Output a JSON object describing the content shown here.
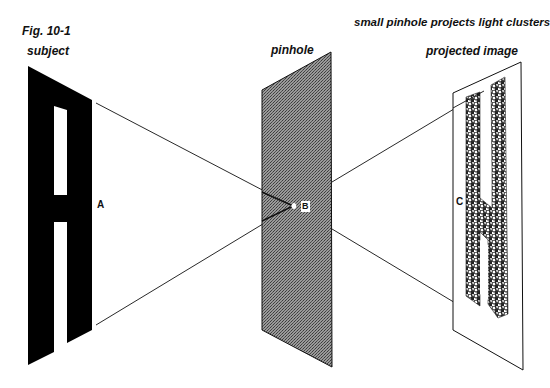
{
  "figure": {
    "fig_label": "Fig. 10-1",
    "caption": "small pinhole projects light clusters"
  },
  "panels": {
    "subject": {
      "title": "subject",
      "point_label": "A"
    },
    "pinhole": {
      "title": "pinhole",
      "point_label": "B"
    },
    "projected": {
      "title": "projected image",
      "point_label": "C"
    }
  },
  "colors": {
    "ink": "#111111",
    "plane_fill": "#8a8a8a",
    "background": "#ffffff"
  }
}
